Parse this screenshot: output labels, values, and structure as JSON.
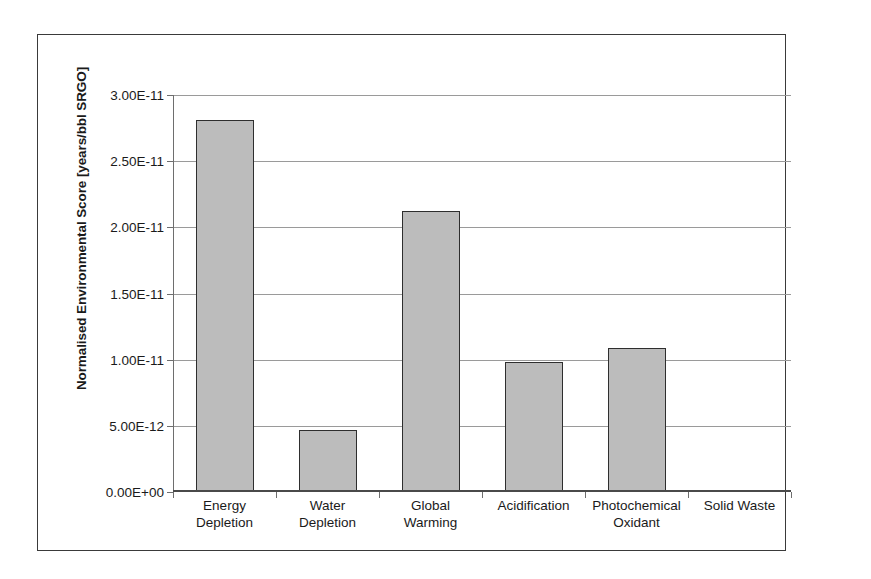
{
  "chart_data": {
    "type": "bar",
    "title": "",
    "xlabel": "",
    "ylabel": "Normalised Environmental Score [years/bbl SRGO]",
    "categories": [
      "Energy Depletion",
      "Water Depletion",
      "Global Warming",
      "Acidification",
      "Photochemical Oxidant",
      "Solid Waste"
    ],
    "category_lines": [
      [
        "Energy",
        "Depletion"
      ],
      [
        "Water",
        "Depletion"
      ],
      [
        "Global",
        "Warming"
      ],
      [
        "Acidification",
        ""
      ],
      [
        "Photochemical",
        "Oxidant"
      ],
      [
        "Solid Waste",
        ""
      ]
    ],
    "values": [
      2.81e-11,
      4.7e-12,
      2.12e-11,
      9.85e-12,
      1.09e-11,
      5e-14
    ],
    "ylim": [
      0,
      3e-11
    ],
    "yticks": [
      0,
      5e-12,
      1e-11,
      1.5e-11,
      2e-11,
      2.5e-11,
      3e-11
    ],
    "ytick_labels": [
      "0.00E+00",
      "5.00E-12",
      "1.00E-11",
      "1.50E-11",
      "2.00E-11",
      "2.50E-11",
      "3.00E-11"
    ],
    "grid": true,
    "legend": false,
    "bar_fill_color": "#bcbcbc",
    "bar_border_color": "#2e2e2e",
    "gridline_color": "#9a9a9a",
    "axis_color": "#4a4a4a",
    "frame_color": "#3a3a3a",
    "background_color": "#ffffff"
  }
}
